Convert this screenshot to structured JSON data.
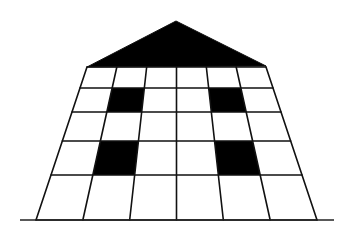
{
  "figure": {
    "title": "House-shaped perspective grid",
    "colors": {
      "ink": "#111111",
      "fill": "#000000",
      "background": "#ffffff"
    }
  },
  "grid": {
    "columns": 6,
    "rows": 5,
    "filled_cells": [
      {
        "row": 2,
        "col": 2,
        "label": "upper-left window"
      },
      {
        "row": 2,
        "col": 5,
        "label": "upper-right window"
      },
      {
        "row": 4,
        "col": 2,
        "label": "lower-left window"
      },
      {
        "row": 4,
        "col": 5,
        "label": "lower-right window"
      }
    ]
  },
  "roof": {
    "shape": "triangle",
    "filled": true
  },
  "ground": {
    "present": true
  }
}
